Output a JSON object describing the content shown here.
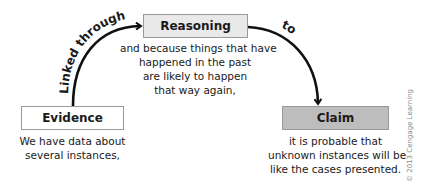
{
  "diagram": {
    "nodes": {
      "evidence": {
        "label": "Evidence",
        "description_lines": [
          "We have data about",
          "several instances,"
        ],
        "fill": "#ffffff"
      },
      "reasoning": {
        "label": "Reasoning",
        "description_lines": [
          "and because things that have",
          "happened in the past",
          "are likely to happen",
          "that way again,"
        ],
        "fill": "#e9e9e9"
      },
      "claim": {
        "label": "Claim",
        "description_lines": [
          "it is probable that",
          "unknown instances will be",
          "like the cases presented."
        ],
        "fill": "#bdbdbd"
      }
    },
    "edges": [
      {
        "from": "evidence",
        "to": "reasoning",
        "label": "Linked through"
      },
      {
        "from": "reasoning",
        "to": "claim",
        "label": "to"
      }
    ],
    "copyright": "© 2013 Cengage Learning"
  }
}
